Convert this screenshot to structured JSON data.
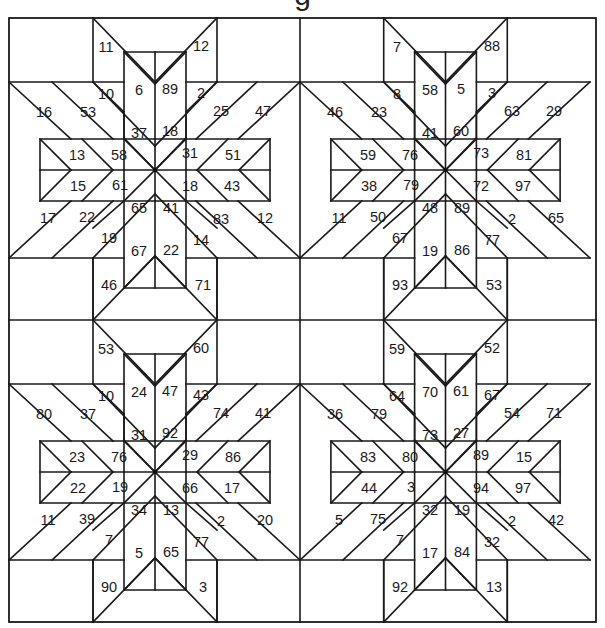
{
  "puzzle": {
    "title": "g",
    "type": "eight-pointed star quilt number puzzle",
    "colors": {
      "line": "#1a1a1a",
      "background": "#ffffff"
    },
    "blocks": [
      {
        "id": "top-left",
        "numbers": {
          "n_top_left_outer": "11",
          "n_top_left_inner": "10",
          "n_top_mid_left": "6",
          "n_top_mid_right": "89",
          "n_top_right_outer": "12",
          "n_top_right_inner": "2",
          "n_center_up_left": "37",
          "n_center_up_right": "18",
          "n_left_upper_outer": "16",
          "n_left_upper_inner": "53",
          "n_left_mid_upper_a": "13",
          "n_left_mid_upper_b": "58",
          "n_left_mid_lower_a": "15",
          "n_left_mid_lower_b": "61",
          "n_left_lower_outer": "17",
          "n_left_lower_inner": "22",
          "n_right_upper_inner": "25",
          "n_right_upper_outer": "47",
          "n_right_mid_upper_a": "31",
          "n_right_mid_upper_b": "51",
          "n_right_mid_lower_a": "18",
          "n_right_mid_lower_b": "43",
          "n_right_lower_inner": "83",
          "n_right_lower_outer": "12",
          "n_center_down_left": "65",
          "n_center_down_right": "41",
          "n_bottom_left_inner": "19",
          "n_bottom_left_outer": "46",
          "n_bottom_mid_left": "67",
          "n_bottom_mid_right": "22",
          "n_bottom_right_inner": "14",
          "n_bottom_right_outer": "71"
        }
      },
      {
        "id": "top-right",
        "numbers": {
          "n_top_left_outer": "7",
          "n_top_left_inner": "8",
          "n_top_mid_left": "58",
          "n_top_mid_right": "5",
          "n_top_right_outer": "88",
          "n_top_right_inner": "3",
          "n_center_up_left": "41",
          "n_center_up_right": "60",
          "n_left_upper_outer": "46",
          "n_left_upper_inner": "23",
          "n_left_mid_upper_a": "59",
          "n_left_mid_upper_b": "76",
          "n_left_mid_lower_a": "38",
          "n_left_mid_lower_b": "79",
          "n_left_lower_outer": "11",
          "n_left_lower_inner": "50",
          "n_right_upper_inner": "63",
          "n_right_upper_outer": "29",
          "n_right_mid_upper_a": "73",
          "n_right_mid_upper_b": "81",
          "n_right_mid_lower_a": "72",
          "n_right_mid_lower_b": "97",
          "n_right_lower_inner": "2",
          "n_right_lower_outer": "65",
          "n_center_down_left": "48",
          "n_center_down_right": "89",
          "n_bottom_left_inner": "67",
          "n_bottom_left_outer": "93",
          "n_bottom_mid_left": "19",
          "n_bottom_mid_right": "86",
          "n_bottom_right_inner": "77",
          "n_bottom_right_outer": "53"
        }
      },
      {
        "id": "bottom-left",
        "numbers": {
          "n_top_left_outer": "53",
          "n_top_left_inner": "10",
          "n_top_mid_left": "24",
          "n_top_mid_right": "47",
          "n_top_right_outer": "60",
          "n_top_right_inner": "43",
          "n_center_up_left": "31",
          "n_center_up_right": "92",
          "n_left_upper_outer": "80",
          "n_left_upper_inner": "37",
          "n_left_mid_upper_a": "23",
          "n_left_mid_upper_b": "76",
          "n_left_mid_lower_a": "22",
          "n_left_mid_lower_b": "19",
          "n_left_lower_outer": "11",
          "n_left_lower_inner": "39",
          "n_right_upper_inner": "74",
          "n_right_upper_outer": "41",
          "n_right_mid_upper_a": "29",
          "n_right_mid_upper_b": "86",
          "n_right_mid_lower_a": "66",
          "n_right_mid_lower_b": "17",
          "n_right_lower_inner": "2",
          "n_right_lower_outer": "20",
          "n_center_down_left": "34",
          "n_center_down_right": "13",
          "n_bottom_left_inner": "7",
          "n_bottom_left_outer": "90",
          "n_bottom_mid_left": "5",
          "n_bottom_mid_right": "65",
          "n_bottom_right_inner": "77",
          "n_bottom_right_outer": "3"
        }
      },
      {
        "id": "bottom-right",
        "numbers": {
          "n_top_left_outer": "59",
          "n_top_left_inner": "64",
          "n_top_mid_left": "70",
          "n_top_mid_right": "61",
          "n_top_right_outer": "52",
          "n_top_right_inner": "67",
          "n_center_up_left": "73",
          "n_center_up_right": "27",
          "n_left_upper_outer": "36",
          "n_left_upper_inner": "79",
          "n_left_mid_upper_a": "83",
          "n_left_mid_upper_b": "80",
          "n_left_mid_lower_a": "44",
          "n_left_mid_lower_b": "3",
          "n_left_lower_outer": "5",
          "n_left_lower_inner": "75",
          "n_right_upper_inner": "54",
          "n_right_upper_outer": "71",
          "n_right_mid_upper_a": "89",
          "n_right_mid_upper_b": "15",
          "n_right_mid_lower_a": "94",
          "n_right_mid_lower_b": "97",
          "n_right_lower_inner": "2",
          "n_right_lower_outer": "42",
          "n_center_down_left": "32",
          "n_center_down_right": "19",
          "n_bottom_left_inner": "7",
          "n_bottom_left_outer": "92",
          "n_bottom_mid_left": "17",
          "n_bottom_mid_right": "84",
          "n_bottom_right_inner": "32",
          "n_bottom_right_outer": "13"
        }
      }
    ]
  }
}
